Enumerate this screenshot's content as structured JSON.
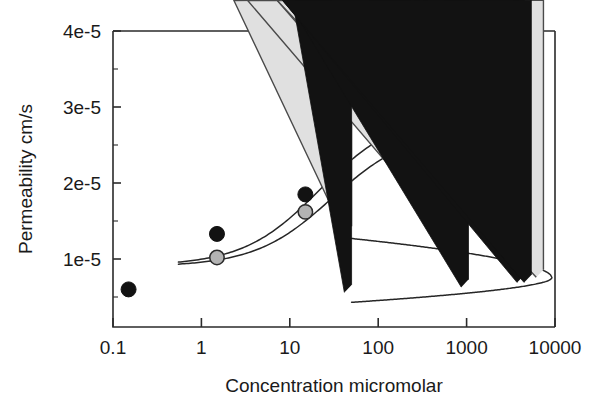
{
  "chart_data": {
    "type": "scatter",
    "title": "",
    "xlabel": "Concentration micromolar",
    "ylabel": "Permeability cm/s",
    "xscale": "log",
    "yscale": "linear",
    "xlim": [
      0.1,
      10000
    ],
    "ylim": [
      0.0,
      4.1e-05
    ],
    "grid": false,
    "legend": "none",
    "xticks": [
      "0.1",
      "1",
      "10",
      "100",
      "1000",
      "10000"
    ],
    "xtick_values": [
      0.1,
      1,
      10,
      100,
      1000,
      10000
    ],
    "yticks": [
      "1e-5",
      "2e-5",
      "3e-5",
      "4e-5"
    ],
    "ytick_values": [
      1e-05,
      2e-05,
      3e-05,
      4e-05
    ],
    "series": [
      {
        "name": "closed-circle-series",
        "marker": "filled-circle",
        "color": "#121212",
        "points": [
          {
            "x": 0.15,
            "y": 6e-06
          },
          {
            "x": 1.5,
            "y": 1.33e-05
          },
          {
            "x": 15,
            "y": 1.85e-05
          },
          {
            "x": 150,
            "y": 2.68e-05
          },
          {
            "x": 1500,
            "y": 3.02e-05
          }
        ]
      },
      {
        "name": "gray-circle-series",
        "marker": "gray-circle",
        "color": "#b3b3b3",
        "points": [
          {
            "x": 1.5,
            "y": 1.02e-05
          },
          {
            "x": 15,
            "y": 1.62e-05
          },
          {
            "x": 150,
            "y": 2.41e-05
          },
          {
            "x": 1500,
            "y": 2.69e-05
          }
        ]
      },
      {
        "name": "open-triangle-series",
        "marker": "open-triangle",
        "color": "#e0e0e0",
        "points": [
          {
            "x": 50,
            "y": 1.33e-05
          },
          {
            "x": 1000,
            "y": 1.15e-05
          },
          {
            "x": 4600,
            "y": 7.6e-06
          },
          {
            "x": 7400,
            "y": 7.6e-06
          }
        ]
      },
      {
        "name": "closed-triangle-series",
        "marker": "filled-triangle",
        "color": "#121212",
        "points": [
          {
            "x": 50,
            "y": 5.6e-06
          },
          {
            "x": 1050,
            "y": 6.3e-06
          },
          {
            "x": 4500,
            "y": 6.9e-06
          },
          {
            "x": 5400,
            "y": 6.9e-06
          }
        ]
      }
    ],
    "fit_curves": [
      {
        "name": "upper-sigmoid-fit",
        "for_series": "closed-circle-series",
        "shape": "sigmoid",
        "bottom": 9.1e-06,
        "top": 2.92e-05,
        "ec50": 22,
        "x_start": 0.55,
        "x_end": 2300
      },
      {
        "name": "lower-sigmoid-fit",
        "for_series": "gray-circle-series",
        "shape": "sigmoid",
        "bottom": 9e-06,
        "top": 2.7e-05,
        "ec50": 30,
        "x_start": 0.55,
        "x_end": 2300
      },
      {
        "name": "decreasing-fit",
        "for_series": "open-triangle-series",
        "shape": "decay",
        "x_start": 50,
        "y_start": 1.27e-05,
        "x_end": 9200,
        "y_end": 7.6e-06
      },
      {
        "name": "increasing-fit",
        "for_series": "closed-triangle-series",
        "shape": "rise",
        "x_start": 50,
        "y_start": 4.3e-06,
        "x_end": 9200,
        "y_end": 7.5e-06
      }
    ]
  },
  "axes": {
    "x_title": "Concentration micromolar",
    "y_title": "Permeability cm/s",
    "x_tick_labels": [
      "0.1",
      "1",
      "10",
      "100",
      "1000",
      "10000"
    ],
    "y_tick_labels": [
      "1e-5",
      "2e-5",
      "3e-5",
      "4e-5"
    ]
  }
}
